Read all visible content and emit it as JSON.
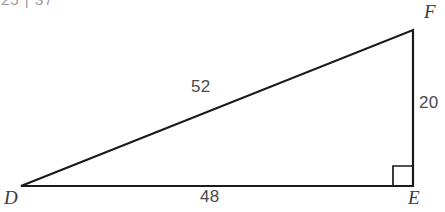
{
  "figure": {
    "type": "right-triangle-diagram",
    "background_color": "#ffffff",
    "stroke_color": "#1a1a1a",
    "label_color": "#4a4a4a",
    "vertex_label_color": "#3a3a3a",
    "clipped_header_text": "25 | 37",
    "vertices": [
      {
        "name": "D",
        "label": "D",
        "x": 21,
        "y": 186
      },
      {
        "name": "E",
        "label": "E",
        "x": 413,
        "y": 186
      },
      {
        "name": "F",
        "label": "F",
        "x": 413,
        "y": 30
      }
    ],
    "sides": [
      {
        "name": "hypotenuse-DF",
        "from": "D",
        "to": "F",
        "label": "52"
      },
      {
        "name": "leg-EF",
        "from": "E",
        "to": "F",
        "label": "20"
      },
      {
        "name": "leg-DE",
        "from": "D",
        "to": "E",
        "label": "48"
      }
    ],
    "right_angle": {
      "at_vertex": "E",
      "marker_size": 20
    }
  }
}
